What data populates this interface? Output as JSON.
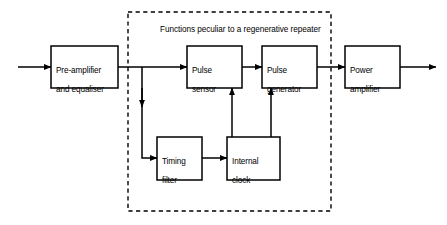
{
  "figure": {
    "background_color": "#ffffff",
    "line_color": "#000000"
  },
  "group": {
    "name": "regenerative-repeater-group",
    "caption": "Functions peculiar to a regenerative repeater",
    "border_style": "dashed",
    "rect": {
      "x": 128,
      "y": 12,
      "w": 203,
      "h": 199
    }
  },
  "blocks": [
    {
      "id": "pre-amplifier-and-equaliser",
      "line1": "Pre-amplifier",
      "line2": "and equaliser",
      "rect": {
        "x": 51,
        "y": 46,
        "w": 67,
        "h": 42
      }
    },
    {
      "id": "pulse-sensor",
      "line1": "Pulse",
      "line2": "sensor",
      "rect": {
        "x": 187,
        "y": 46,
        "w": 55,
        "h": 42
      }
    },
    {
      "id": "pulse-generator",
      "line1": "Pulse",
      "line2": "generator",
      "rect": {
        "x": 262,
        "y": 46,
        "w": 55,
        "h": 42
      }
    },
    {
      "id": "power-amplifier",
      "line1": "Power",
      "line2": "amplifier",
      "rect": {
        "x": 345,
        "y": 46,
        "w": 55,
        "h": 42
      }
    },
    {
      "id": "timing-filter",
      "line1": "Timing",
      "line2": "filter",
      "rect": {
        "x": 157,
        "y": 137,
        "w": 45,
        "h": 43
      }
    },
    {
      "id": "internal-clock",
      "line1": "Internal",
      "line2": "clock",
      "rect": {
        "x": 227,
        "y": 137,
        "w": 53,
        "h": 43
      }
    }
  ],
  "connections": [
    {
      "id": "input-to-pre-amplifier",
      "from": "signal-input",
      "to": "pre-amplifier-and-equaliser"
    },
    {
      "id": "pre-amplifier-to-pulse-sensor",
      "from": "pre-amplifier-and-equaliser",
      "to": "pulse-sensor"
    },
    {
      "id": "pre-amplifier-to-timing-filter",
      "from": "pre-amplifier-and-equaliser",
      "to": "timing-filter"
    },
    {
      "id": "pulse-sensor-to-pulse-generator",
      "from": "pulse-sensor",
      "to": "pulse-generator"
    },
    {
      "id": "pulse-generator-to-power-amplifier",
      "from": "pulse-generator",
      "to": "power-amplifier"
    },
    {
      "id": "timing-filter-to-internal-clock",
      "from": "timing-filter",
      "to": "internal-clock"
    },
    {
      "id": "internal-clock-to-pulse-sensor",
      "from": "internal-clock",
      "to": "pulse-sensor"
    },
    {
      "id": "internal-clock-to-pulse-generator",
      "from": "internal-clock",
      "to": "pulse-generator"
    },
    {
      "id": "power-amplifier-to-output",
      "from": "power-amplifier",
      "to": "signal-output"
    }
  ]
}
